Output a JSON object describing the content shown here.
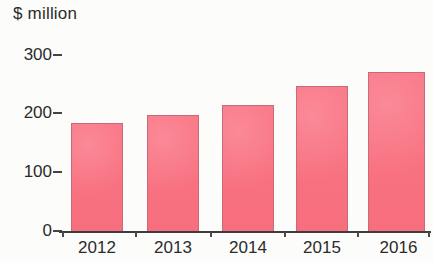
{
  "chart_data": {
    "type": "bar",
    "title": "$ million",
    "xlabel": "",
    "ylabel": "$ million",
    "categories": [
      "2012",
      "2013",
      "2014",
      "2015",
      "2016"
    ],
    "values": [
      185,
      198,
      215,
      247,
      271
    ],
    "series": [
      {
        "name": "$ million",
        "values": [
          185,
          198,
          215,
          247,
          271
        ]
      }
    ],
    "ylim": [
      0,
      300
    ],
    "yticks": [
      "0",
      "100",
      "200",
      "300"
    ],
    "ytick_values": [
      0,
      100,
      200,
      300
    ],
    "grid": false,
    "legend": false,
    "bar_color": "#f8717f",
    "bar_outline_color": "#c86a77",
    "axis_color": "#3d3d3d",
    "text_color": "#2b2b2b",
    "background_color": "#fcfcfa"
  }
}
